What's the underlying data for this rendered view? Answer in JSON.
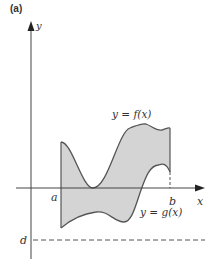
{
  "figure": {
    "panel_label": "(a)",
    "axis_labels": {
      "x": "x",
      "y": "y"
    },
    "points": {
      "a": "a",
      "b": "b",
      "d": "d"
    },
    "curve_labels": {
      "f": "y = f(x)",
      "g": "y = g(x)"
    },
    "colors": {
      "fill": "#d4d4d4",
      "curve": "#555555",
      "axis": "#444444",
      "background": "#ffffff"
    }
  }
}
